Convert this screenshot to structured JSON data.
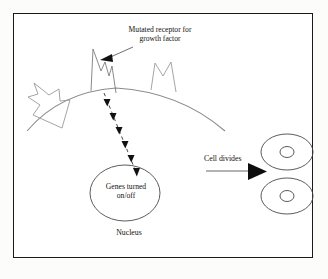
{
  "diagram": {
    "title_label": "Mutated receptor for\ngrowth factor",
    "nucleus_inner_label": "Genes turned\non/off",
    "nucleus_label": "Nucleus",
    "division_label": "Cell divides",
    "colors": {
      "frame": "#1a1a1a",
      "stroke_dark": "#111111",
      "stroke_light": "#8c8c8c",
      "background": "#ffffff"
    },
    "icons": {
      "membrane": "cell-membrane-arc",
      "receptor_mutated": "mutated-receptor-icon",
      "receptor_normal_right": "normal-receptor-icon",
      "receptor_normal_left": "normal-receptor-icon",
      "signal": "dashed-signal-arrow-chain",
      "pointer": "label-pointer-arrow",
      "division_arrow": "cell-division-arrow",
      "daughter_cell_top": "daughter-cell-icon",
      "daughter_cell_bottom": "daughter-cell-icon"
    },
    "counts": {
      "signal_arrowheads": 6,
      "receptors": 3,
      "daughter_cells": 2
    }
  }
}
